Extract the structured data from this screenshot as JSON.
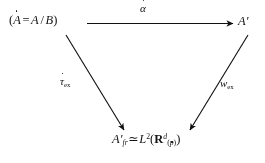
{
  "diagram": {
    "kind": "commutative-diagram",
    "background_color": "#ffffff",
    "ink_color": "#141414",
    "nodes": {
      "source": {
        "id": "source",
        "parts": {
          "open_paren": "(",
          "a_dotted": "A",
          "equals": "=",
          "a_plain": "A",
          "slash": "/",
          "b_script": "B",
          "close_paren": ")"
        },
        "plain_text": "( Ȧ = A / B )"
      },
      "target": {
        "id": "target",
        "parts": {
          "a_script": "A",
          "prime": "′"
        },
        "plain_text": "A′"
      },
      "bottom": {
        "id": "bottom",
        "parts": {
          "a_script": "A",
          "prime": "′",
          "subscript_fr": "fr",
          "simeq": "≃",
          "l_letter": "L",
          "exponent_two": "2",
          "open_paren": "(",
          "r_bold": "R",
          "sup_d": "d",
          "sub_open": "(",
          "sub_p": "p",
          "sub_close": ")",
          "close_paren": ")"
        },
        "plain_text": "A′_fr ≃ L²( R^d_(ṗ) )"
      }
    },
    "arrows": [
      {
        "id": "top-arrow",
        "from": "source",
        "to": "target",
        "direction": "right",
        "label": {
          "base": "α",
          "accent": "dot",
          "plain_text": "α̇"
        }
      },
      {
        "id": "left-arrow",
        "from": "source",
        "to": "bottom",
        "direction": "down-right",
        "label": {
          "base": "τ",
          "accent": "dot",
          "subscript": "ex",
          "plain_text": "τ̇_ex"
        }
      },
      {
        "id": "right-arrow",
        "from": "target",
        "to": "bottom",
        "direction": "down-left",
        "label": {
          "base": "w",
          "accent": "none",
          "subscript": "ex",
          "plain_text": "w_ex"
        }
      }
    ]
  }
}
